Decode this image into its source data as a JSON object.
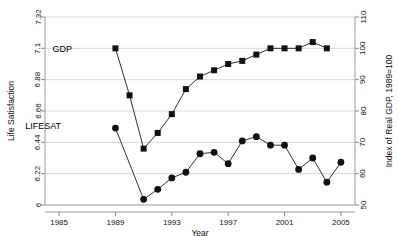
{
  "chart_data": {
    "type": "line",
    "title": "",
    "xlabel": "Year",
    "ylabel": "Life Satisfaction",
    "y2label": "Index of Real GDP, 1989=100",
    "x": [
      1989,
      1990,
      1991,
      1992,
      1993,
      1994,
      1995,
      1996,
      1997,
      1998,
      1999,
      2000,
      2001,
      2002,
      2003,
      2004,
      2005
    ],
    "xlim": [
      1984,
      2006
    ],
    "xticks": [
      1985,
      1989,
      1993,
      1997,
      2001,
      2005
    ],
    "xtick_labels": [
      "1985",
      "1989",
      "1993",
      "1997",
      "2001",
      "2005"
    ],
    "ylim": [
      6,
      7.32
    ],
    "yticks": [
      6,
      6.22,
      6.44,
      6.66,
      6.88,
      7.1,
      7.32
    ],
    "ytick_labels": [
      "6",
      "6.22",
      "6.44",
      "6.66",
      "6.88",
      "7.1",
      "7.32"
    ],
    "y2lim": [
      50,
      110
    ],
    "y2ticks": [
      50,
      60,
      70,
      80,
      90,
      100,
      110
    ],
    "y2tick_labels": [
      "50",
      "60",
      "70",
      "80",
      "90",
      "100",
      "110"
    ],
    "grid": true,
    "legend_position": "inline-labels",
    "series": [
      {
        "name": "LIFESAT",
        "label": "LIFESAT",
        "axis": "left",
        "marker": "circle",
        "color": "#111111",
        "x": [
          1989,
          1990,
          1991,
          1992,
          1993,
          1994,
          1995,
          1996,
          1997,
          1998,
          1999,
          2000,
          2001,
          2002,
          2003,
          2004,
          2005
        ],
        "values": [
          6.54,
          null,
          6.04,
          6.11,
          6.19,
          6.23,
          6.36,
          6.37,
          6.29,
          6.45,
          6.48,
          6.42,
          6.42,
          6.25,
          6.33,
          6.16,
          6.3
        ]
      },
      {
        "name": "GDP",
        "label": "GDP",
        "axis": "right",
        "marker": "square",
        "color": "#111111",
        "x": [
          1989,
          1990,
          1991,
          1992,
          1993,
          1994,
          1995,
          1996,
          1997,
          1998,
          1999,
          2000,
          2001,
          2002,
          2003,
          2004,
          2005
        ],
        "values": [
          100,
          85,
          68,
          73,
          79,
          87,
          91,
          93,
          95,
          96,
          98,
          100,
          100,
          100,
          102,
          100,
          null
        ]
      }
    ],
    "annotations": [
      {
        "name": "gdp-series-label",
        "text": "GDP",
        "x_px": 72,
        "y_px": 49
      },
      {
        "name": "lifesat-series-label",
        "text": "LIFESAT",
        "x_px": 61,
        "y_px": 126
      }
    ]
  }
}
